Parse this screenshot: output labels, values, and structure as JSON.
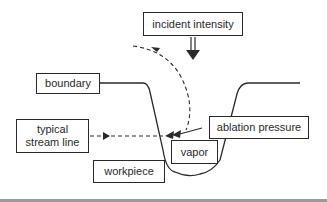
{
  "diagram": {
    "labels": {
      "incident_intensity": "incident intensity",
      "boundary": "boundary",
      "typical_stream_line_1": "typical",
      "typical_stream_line_2": "stream line",
      "ablation_pressure": "ablation pressure",
      "vapor": "vapor",
      "workpiece": "workpiece"
    },
    "colors": {
      "stroke": "#2a2a2a",
      "background": "#ffffff",
      "bottom_rule": "#9a9a9a"
    }
  }
}
